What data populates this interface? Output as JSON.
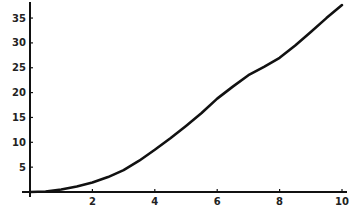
{
  "chart_data": {
    "type": "line",
    "title": "",
    "xlabel": "",
    "ylabel": "",
    "xlim": [
      0,
      10
    ],
    "ylim": [
      0,
      35
    ],
    "grid": false,
    "legend": null,
    "x_ticks": [
      2,
      4,
      6,
      8,
      10
    ],
    "x_tick_labels": [
      "2",
      "4",
      "6",
      "8",
      "10"
    ],
    "y_ticks": [
      5,
      10,
      15,
      20,
      25,
      30,
      35
    ],
    "y_tick_labels": [
      "5",
      "10",
      "15",
      "20",
      "25",
      "30",
      "35"
    ],
    "series": [
      {
        "name": "curve",
        "color": "#111111",
        "x": [
          0,
          0.5,
          1,
          1.5,
          2,
          2.5,
          3,
          3.5,
          4,
          4.5,
          5,
          5.5,
          6,
          6.5,
          7,
          7.5,
          8,
          8.5,
          9,
          9.5,
          10
        ],
        "y": [
          0,
          0.1,
          0.5,
          1.1,
          1.9,
          3.0,
          4.4,
          6.3,
          8.5,
          10.8,
          13.3,
          15.9,
          18.8,
          21.2,
          23.5,
          25.2,
          27.0,
          29.5,
          32.2,
          35.0,
          37.6
        ]
      }
    ]
  }
}
